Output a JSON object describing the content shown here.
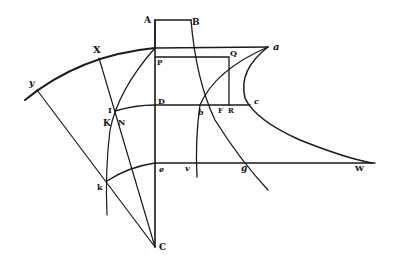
{
  "figure": {
    "type": "geometric-diagram",
    "ink_color": "#1a1a1a",
    "background": "#ffffff",
    "labels": {
      "A": "A",
      "B": "B",
      "a": "a",
      "X": "X",
      "y": "y",
      "P": "P",
      "Q": "Q",
      "D": "D",
      "I": "I",
      "K": "K",
      "N": "N",
      "b": "b",
      "F": "F",
      "R": "R",
      "c": "c",
      "e": "e",
      "v": "v",
      "g": "g",
      "W": "W",
      "k": "k",
      "C": "C"
    }
  }
}
